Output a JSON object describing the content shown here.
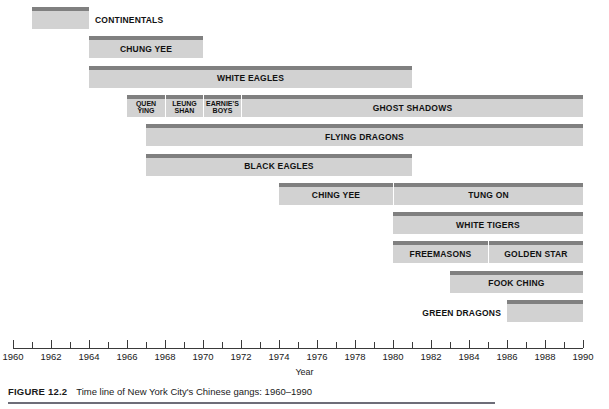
{
  "figure": {
    "number_label": "FIGURE 12.2",
    "caption": "Time line of New York City's Chinese gangs: 1960–1990"
  },
  "axis": {
    "title": "Year",
    "min": 1960,
    "max": 1990,
    "tick_step": 1,
    "label_step": 2,
    "labels": [
      "1960",
      "1962",
      "1964",
      "1966",
      "1968",
      "1970",
      "1972",
      "1974",
      "1976",
      "1978",
      "1980",
      "1982",
      "1984",
      "1986",
      "1988",
      "1990"
    ]
  },
  "chart_data": {
    "type": "bar",
    "title": "Time line of New York City's Chinese gangs: 1960–1990",
    "xlabel": "Year",
    "ylabel": "",
    "xlim": [
      1960,
      1990
    ],
    "grid": false,
    "legend": "none",
    "orientation": "horizontal-timeline",
    "categories": [
      "CONTINENTALS",
      "CHUNG YEE",
      "WHITE EAGLES",
      "QUEN YING",
      "LEUNG SHAN",
      "EARNIE'S BOYS",
      "GHOST SHADOWS",
      "FLYING DRAGONS",
      "BLACK EAGLES",
      "CHING YEE",
      "TUNG ON",
      "WHITE TIGERS",
      "FREEMASONS",
      "GOLDEN STAR",
      "FOOK CHING",
      "GREEN DRAGONS"
    ],
    "rows": [
      {
        "row": 0,
        "bars": [
          {
            "label": "CONTINENTALS",
            "start": 1961,
            "end": 1964,
            "label_position": "right-outside"
          }
        ]
      },
      {
        "row": 1,
        "bars": [
          {
            "label": "CHUNG YEE",
            "start": 1964,
            "end": 1970,
            "label_position": "inside"
          }
        ]
      },
      {
        "row": 2,
        "bars": [
          {
            "label": "WHITE EAGLES",
            "start": 1964,
            "end": 1981,
            "label_position": "inside"
          }
        ]
      },
      {
        "row": 3,
        "bars": [
          {
            "label": "QUEN YING",
            "label_lines": [
              "QUEN",
              "YING"
            ],
            "start": 1966,
            "end": 1968,
            "label_position": "inside"
          },
          {
            "label": "LEUNG SHAN",
            "label_lines": [
              "LEUNG",
              "SHAN"
            ],
            "start": 1968,
            "end": 1970,
            "label_position": "inside"
          },
          {
            "label": "EARNIE'S BOYS",
            "label_lines": [
              "EARNIE'S",
              "BOYS"
            ],
            "start": 1970,
            "end": 1972,
            "label_position": "inside"
          },
          {
            "label": "GHOST SHADOWS",
            "start": 1972,
            "end": 1990,
            "label_position": "inside"
          }
        ]
      },
      {
        "row": 4,
        "bars": [
          {
            "label": "FLYING DRAGONS",
            "start": 1967,
            "end": 1990,
            "label_position": "inside"
          }
        ]
      },
      {
        "row": 5,
        "bars": [
          {
            "label": "BLACK EAGLES",
            "start": 1967,
            "end": 1981,
            "label_position": "inside"
          }
        ]
      },
      {
        "row": 6,
        "bars": [
          {
            "label": "CHING YEE",
            "start": 1974,
            "end": 1980,
            "label_position": "inside"
          },
          {
            "label": "TUNG ON",
            "start": 1980,
            "end": 1990,
            "label_position": "inside"
          }
        ]
      },
      {
        "row": 7,
        "bars": [
          {
            "label": "WHITE TIGERS",
            "start": 1980,
            "end": 1990,
            "label_position": "inside"
          }
        ]
      },
      {
        "row": 8,
        "bars": [
          {
            "label": "FREEMASONS",
            "start": 1980,
            "end": 1985,
            "label_position": "inside"
          },
          {
            "label": "GOLDEN STAR",
            "start": 1985,
            "end": 1990,
            "label_position": "inside"
          }
        ]
      },
      {
        "row": 9,
        "bars": [
          {
            "label": "FOOK CHING",
            "start": 1983,
            "end": 1990,
            "label_position": "inside"
          }
        ]
      },
      {
        "row": 10,
        "bars": [
          {
            "label": "GREEN DRAGONS",
            "start": 1986,
            "end": 1990,
            "label_position": "left-outside"
          }
        ]
      }
    ]
  },
  "colors": {
    "bar_body": "#d2d2d2",
    "bar_top_stripe": "#808080",
    "axis_line": "#3a3a3a",
    "caption_rule": "#6d6d78",
    "text": "#1a1a1a",
    "background": "#ffffff"
  }
}
